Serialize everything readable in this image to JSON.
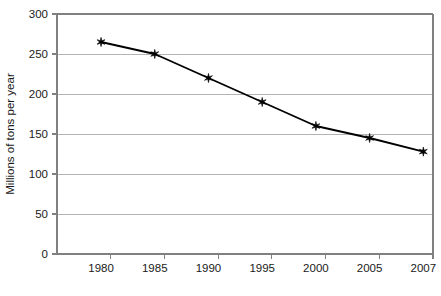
{
  "chart_data": {
    "type": "line",
    "title": "",
    "subtitle": "",
    "xlabel": "",
    "ylabel": "Millions of tons per year",
    "x": [
      1980,
      1985,
      1990,
      1995,
      2000,
      2005,
      2007
    ],
    "values": [
      265,
      250,
      220,
      190,
      160,
      145,
      128
    ],
    "series": [
      {
        "name": "Millions of tons per year",
        "values": [
          265,
          250,
          220,
          190,
          160,
          145,
          128
        ]
      }
    ],
    "xtick_labels": [
      "1980",
      "1985",
      "1990",
      "1995",
      "2000",
      "2005",
      "2007"
    ],
    "ytick_labels": [
      "0",
      "50",
      "100",
      "150",
      "200",
      "250",
      "300"
    ],
    "ytick_values": [
      0,
      50,
      100,
      150,
      200,
      250,
      300
    ],
    "ylim": [
      0,
      300
    ],
    "grid": "horizontal",
    "legend": "none",
    "marker": "six-pointed-star",
    "line_color": "#000000",
    "marker_color": "#000000",
    "grid_color": "#b3b3b3",
    "axis_color": "#808080",
    "background_color": "#ffffff"
  }
}
